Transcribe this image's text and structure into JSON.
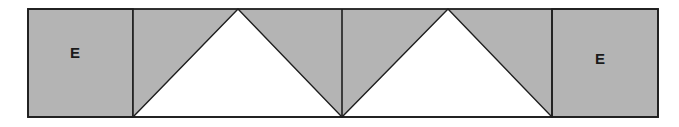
{
  "diagram": {
    "colors": {
      "fill_gray": "#b4b4b4",
      "fill_white": "#ffffff",
      "stroke": "#1e1e1e"
    },
    "blocks": [
      {
        "type": "square",
        "label": "E"
      },
      {
        "type": "triangle-unit",
        "label": ""
      },
      {
        "type": "triangle-unit",
        "label": ""
      },
      {
        "type": "square",
        "label": "E"
      }
    ]
  }
}
